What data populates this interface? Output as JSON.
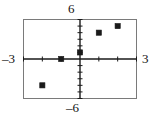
{
  "chart_data": {
    "type": "scatter",
    "title": "",
    "xlabel": "",
    "ylabel": "",
    "xlim": [
      -3,
      3
    ],
    "ylim": [
      -6,
      6
    ],
    "grid": false,
    "legend": null,
    "x_axis_labels": {
      "left": "–3",
      "right": "3"
    },
    "y_axis_labels": {
      "top": "6",
      "bottom": "–6"
    },
    "x_tick_interval": 1,
    "y_tick_interval": 1,
    "points": [
      {
        "x": -2,
        "y": -4
      },
      {
        "x": -1,
        "y": 0
      },
      {
        "x": 0,
        "y": 1
      },
      {
        "x": 1,
        "y": 4
      },
      {
        "x": 2,
        "y": 5
      }
    ],
    "marker": "square",
    "marker_color": "#1a1a1a",
    "axis_color": "#1a1a1a",
    "frame_color": "#7a7a7a",
    "background_color": "#ffffff"
  },
  "figure": {
    "name": "coordinate-plane-scatter-plot"
  }
}
